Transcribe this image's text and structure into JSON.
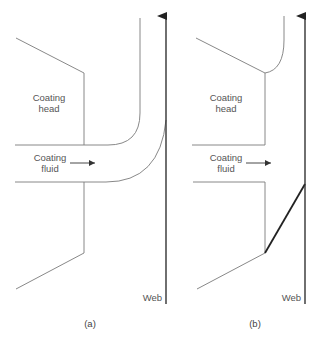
{
  "figure": {
    "panels": [
      {
        "id": "a",
        "caption": "(a)",
        "head_label_line1": "Coating",
        "head_label_line2": "head",
        "fluid_label_line1": "Coating",
        "fluid_label_line2": "fluid",
        "web_label": "Web"
      },
      {
        "id": "b",
        "caption": "(b)",
        "head_label_line1": "Coating",
        "head_label_line2": "head",
        "fluid_label_line1": "Coating",
        "fluid_label_line2": "fluid",
        "web_label": "Web"
      }
    ],
    "colors": {
      "line": "#7a7a7a",
      "web": "#333333",
      "text": "#555555",
      "background": "#ffffff"
    }
  }
}
